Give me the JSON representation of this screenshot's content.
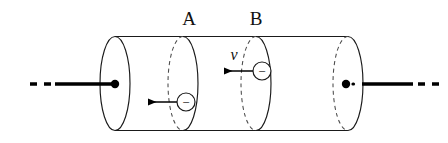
{
  "figure": {
    "type": "physics-diagram",
    "background_color": "#ffffff",
    "stroke_color": "#1a1a1a",
    "dash_color": "#4a4a4a",
    "lead_color": "#000000"
  },
  "labels": {
    "cross_section_a": "A",
    "cross_section_b": "B",
    "velocity": "v"
  },
  "electrons": [
    {
      "id": "electron-a",
      "charge_sign": "−",
      "motion": "leftward"
    },
    {
      "id": "electron-b",
      "charge_sign": "−",
      "motion": "leftward"
    }
  ],
  "geometry": {
    "cylinder": {
      "left_face_cx": 115,
      "right_face_cx": 348,
      "face_rx": 15,
      "face_ry": 47,
      "center_y": 83.5,
      "top_y": 36.5,
      "bottom_y": 130.5
    },
    "cross_sections": [
      {
        "name": "A",
        "cx": 183,
        "label_x": 189,
        "label_y": 24
      },
      {
        "name": "B",
        "cx": 256,
        "label_x": 256,
        "label_y": 24
      }
    ],
    "leads": {
      "left": {
        "dash_from": 30,
        "dash_to": 52,
        "solid_from": 55,
        "solid_to": 115,
        "y": 84
      },
      "right": {
        "solid_from": 358,
        "solid_to": 413,
        "dash_from": 418,
        "dash_to": 440,
        "y": 84
      }
    },
    "electron_markers": [
      {
        "id": "electron-a",
        "cx": 186,
        "cy": 102,
        "r": 9,
        "arrow_tail_x": 177,
        "arrow_head_x": 146,
        "arrow_y": 102
      },
      {
        "id": "electron-b",
        "cx": 262,
        "cy": 71,
        "r": 9,
        "arrow_tail_x": 253,
        "arrow_head_x": 222,
        "arrow_y": 71
      }
    ],
    "velocity_label": {
      "x": 232,
      "y": 58
    }
  }
}
